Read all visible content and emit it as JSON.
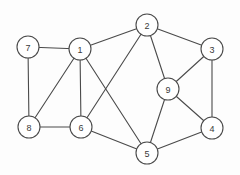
{
  "diagram": {
    "type": "undirected-graph",
    "title": "",
    "width": 240,
    "height": 175,
    "background_color": "#fdfdfd",
    "node_fill_color": "#ffffff",
    "node_stroke_color": "#4a4a4a",
    "edge_color": "#4a4a4a",
    "label_color": "#3a3a3a",
    "node_radius": 11,
    "node_count": 9,
    "edge_count": 16,
    "nodes": [
      {
        "id": "1",
        "label": "1",
        "x": 80,
        "y": 49
      },
      {
        "id": "2",
        "label": "2",
        "x": 147,
        "y": 25
      },
      {
        "id": "3",
        "label": "3",
        "x": 212,
        "y": 49
      },
      {
        "id": "4",
        "label": "4",
        "x": 212,
        "y": 128
      },
      {
        "id": "5",
        "label": "5",
        "x": 147,
        "y": 153
      },
      {
        "id": "6",
        "label": "6",
        "x": 81,
        "y": 127
      },
      {
        "id": "7",
        "label": "7",
        "x": 28,
        "y": 47
      },
      {
        "id": "8",
        "label": "8",
        "x": 29,
        "y": 127
      },
      {
        "id": "9",
        "label": "9",
        "x": 168,
        "y": 89
      }
    ],
    "edges": [
      {
        "source": "7",
        "target": "1"
      },
      {
        "source": "7",
        "target": "8"
      },
      {
        "source": "1",
        "target": "2"
      },
      {
        "source": "1",
        "target": "8"
      },
      {
        "source": "1",
        "target": "6"
      },
      {
        "source": "1",
        "target": "5"
      },
      {
        "source": "2",
        "target": "3"
      },
      {
        "source": "2",
        "target": "6"
      },
      {
        "source": "2",
        "target": "9"
      },
      {
        "source": "3",
        "target": "9"
      },
      {
        "source": "3",
        "target": "4"
      },
      {
        "source": "9",
        "target": "4"
      },
      {
        "source": "9",
        "target": "5"
      },
      {
        "source": "4",
        "target": "5"
      },
      {
        "source": "5",
        "target": "6"
      },
      {
        "source": "6",
        "target": "8"
      }
    ]
  }
}
